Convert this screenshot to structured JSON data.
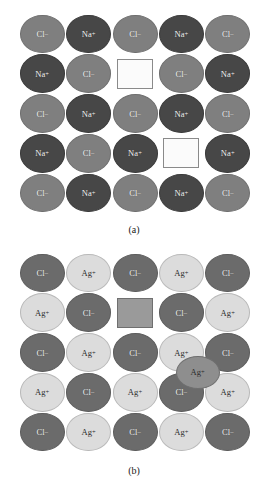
{
  "figure": {
    "type": "crystal-lattice-defect-diagram",
    "panels": [
      {
        "id": "a",
        "caption": "(a)",
        "compound": "NaCl",
        "defect_type": "Schottky defect",
        "grid": {
          "rows": 5,
          "cols": 5
        },
        "colors": {
          "anion": "#7f7f7f",
          "cation": "#474747",
          "vacancy_fill": "#fbfbfb",
          "vacancy_border": "#8a8a8a"
        },
        "species": {
          "anion": {
            "label": "Cl",
            "charge": "–"
          },
          "cation": {
            "label": "Na",
            "charge": "+"
          }
        },
        "sites": [
          [
            "Cl",
            "Na",
            "Cl",
            "Na",
            "Cl"
          ],
          [
            "Na",
            "Cl",
            "vacancy",
            "Cl",
            "Na"
          ],
          [
            "Cl",
            "Na",
            "Cl",
            "Na",
            "Cl"
          ],
          [
            "Na",
            "Cl",
            "Na",
            "vacancy",
            "Na"
          ],
          [
            "Cl",
            "Na",
            "Cl",
            "Na",
            "Cl"
          ]
        ],
        "vacancies": [
          {
            "row": 1,
            "col": 2,
            "style": "white"
          },
          {
            "row": 3,
            "col": 3,
            "style": "white"
          }
        ],
        "interstitials": []
      },
      {
        "id": "b",
        "caption": "(b)",
        "compound": "AgCl",
        "defect_type": "Frenkel defect",
        "grid": {
          "rows": 5,
          "cols": 5
        },
        "colors": {
          "anion": "#6b6b6b",
          "cation": "#dcdcdc",
          "interstitial": "#8e8e8e",
          "vacancy_fill": "#9a9a9a",
          "vacancy_border": "#6f6f6f"
        },
        "species": {
          "anion": {
            "label": "Cl",
            "charge": "–"
          },
          "cation": {
            "label": "Ag",
            "charge": "+"
          }
        },
        "sites": [
          [
            "Cl",
            "Ag",
            "Cl",
            "Ag",
            "Cl"
          ],
          [
            "Ag",
            "Cl",
            "vacancy",
            "Cl",
            "Ag"
          ],
          [
            "Cl",
            "Ag",
            "Cl",
            "Ag",
            "Cl"
          ],
          [
            "Ag",
            "Cl",
            "Ag",
            "Cl",
            "Ag"
          ],
          [
            "Cl",
            "Ag",
            "Cl",
            "Ag",
            "Cl"
          ]
        ],
        "vacancies": [
          {
            "row": 1,
            "col": 2,
            "style": "gray"
          }
        ],
        "interstitials": [
          {
            "label": "Ag",
            "charge": "+",
            "between_rows": [
              2,
              3
            ],
            "between_cols": [
              3,
              4
            ]
          }
        ]
      }
    ]
  },
  "labels": {
    "cl": "Cl",
    "cl_charge": "–",
    "na": "Na",
    "na_charge": "+",
    "ag": "Ag",
    "ag_charge": "+",
    "caption_a": "(a)",
    "caption_b": "(b)"
  }
}
